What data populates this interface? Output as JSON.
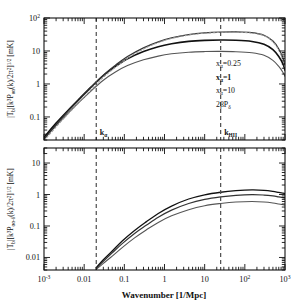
{
  "figure": {
    "background_color": "#ffffff",
    "frame_color": "#111111",
    "width": 299,
    "height": 308
  },
  "axes": {
    "xlabel": "Wavenumber [1/Mpc]",
    "x_ticklabels": [
      "10",
      "0.01",
      "0.1",
      "1",
      "10",
      "10",
      "10"
    ],
    "x_tick_exponents": [
      "-3",
      "",
      "",
      "",
      "",
      "2",
      "3"
    ],
    "x_tickvalues": [
      0.001,
      0.01,
      0.1,
      1,
      10,
      100,
      1000
    ],
    "xlim": [
      0.001,
      1000
    ],
    "top_y_ticklabels": [
      "10",
      "10",
      "1",
      "0.1"
    ],
    "top_y_tick_exponents": [
      "2",
      "",
      "",
      ""
    ],
    "top_y_tickvalues": [
      100,
      10,
      1,
      0.1
    ],
    "top_ylim": [
      0.02,
      100
    ],
    "bottom_y_ticklabels": [
      "10",
      "1",
      "0.1",
      "0.01"
    ],
    "bottom_y_tickvalues": [
      10,
      1,
      0.1,
      0.01
    ],
    "bottom_ylim": [
      0.004,
      30
    ]
  },
  "top_panel": {
    "ylabel_parts": {
      "p1": "|T",
      "p1_sub": "b",
      "p2": "|[k",
      "p2_sup": "3",
      "p3": "P",
      "p3_sub": "αα",
      "p4": "(k)/2π",
      "p4_sup": "2",
      "p5": "]",
      "p5_sup": "1/2",
      "p6": " [mK]"
    },
    "ylabel_plain": "|T_b|[k^3 P_aa(k)/2pi^2]^1/2 [mK]"
  },
  "bottom_panel": {
    "ylabel_parts": {
      "p1": "|T",
      "p1_sub": "b",
      "p2": "|[k",
      "p2_sup": "3",
      "p3": "P",
      "p3_sub": "αα-δ",
      "p4": "(k)/2π",
      "p4_sup": "2",
      "p5": "]",
      "p5_sup": "1/2",
      "p6": " [mK]"
    },
    "ylabel_plain": "|T_b|[k^3 P_aa-d(k)/2pi^2]^1/2 [mK]"
  },
  "vlines": [
    {
      "name": "k-alpha",
      "x": 0.02,
      "label_main": "k",
      "label_sub": "α",
      "color": "#4d4d4d",
      "dash": "4,3"
    },
    {
      "name": "k-HII",
      "x": 25,
      "label_main": "k",
      "label_sub": "HII",
      "color": "#4d4d4d",
      "dash": "4,3"
    }
  ],
  "legend": {
    "entries": [
      {
        "main": "x",
        "sub": "α",
        "rest": "=0.25",
        "color": "#555555",
        "weight": "normal"
      },
      {
        "main": "x",
        "sub": "α",
        "rest": "=1",
        "color": "#111111",
        "weight": "bold"
      },
      {
        "main": "x",
        "sub": "α",
        "rest": "=10",
        "color": "#333333",
        "weight": "normal"
      },
      {
        "main": "2βP",
        "sub": "δ",
        "rest": "",
        "color": "#9a9a9a",
        "weight": "normal"
      }
    ]
  },
  "chart_data": {
    "type": "line",
    "title": "",
    "xlabel": "Wavenumber [1/Mpc]",
    "xscale": "log",
    "yscale": "log",
    "xlim": [
      0.001,
      1000
    ],
    "grid": false,
    "legend_position": "right-middle",
    "panels": [
      {
        "name": "top",
        "ylabel": "|T_b|[k^3 P_aa(k)/2pi^2]^1/2 [mK]",
        "ylim": [
          0.02,
          100
        ],
        "series": [
          {
            "name": "x_a=0.25",
            "color": "#555555",
            "width": 1.1,
            "x": [
              0.001,
              0.002,
              0.004,
              0.008,
              0.015,
              0.03,
              0.06,
              0.12,
              0.3,
              0.7,
              1.5,
              4,
              10,
              25,
              60,
              150,
              300,
              500,
              700,
              900,
              1000
            ],
            "y": [
              0.022,
              0.055,
              0.13,
              0.3,
              0.62,
              1.3,
              2.3,
              3.6,
              5.4,
              7.0,
              8.2,
              9.2,
              9.6,
              9.7,
              9.5,
              8.8,
              7.4,
              5.2,
              3.4,
              2.2,
              1.7
            ]
          },
          {
            "name": "x_a=1",
            "color": "#111111",
            "width": 1.6,
            "x": [
              0.001,
              0.002,
              0.004,
              0.008,
              0.015,
              0.03,
              0.06,
              0.12,
              0.3,
              0.7,
              1.5,
              4,
              10,
              25,
              60,
              150,
              300,
              500,
              700,
              900,
              1000
            ],
            "y": [
              0.024,
              0.065,
              0.16,
              0.38,
              0.82,
              1.8,
              3.4,
              5.8,
              9.6,
              13.5,
              16.5,
              19.5,
              21.0,
              21.5,
              21.2,
              19.5,
              16.0,
              11.0,
              6.8,
              3.9,
              2.6
            ]
          },
          {
            "name": "x_a=10",
            "color": "#333333",
            "width": 1.3,
            "x": [
              0.001,
              0.002,
              0.004,
              0.008,
              0.015,
              0.03,
              0.06,
              0.12,
              0.3,
              0.7,
              1.5,
              4,
              10,
              25,
              60,
              150,
              300,
              500,
              700,
              900,
              1000
            ],
            "y": [
              0.021,
              0.058,
              0.15,
              0.36,
              0.8,
              1.85,
              3.7,
              6.8,
              12.5,
              19.0,
              25.0,
              31.5,
              35.5,
              37.5,
              38.0,
              36.0,
              30.0,
              20.0,
              11.5,
              5.8,
              3.5
            ]
          },
          {
            "name": "2bP_d",
            "color": "#9a9a9a",
            "width": 1.1,
            "dash": "2,2",
            "x": [
              0.001,
              0.002,
              0.004,
              0.008,
              0.015,
              0.03,
              0.06,
              0.12,
              0.3,
              0.7,
              1.5,
              4,
              10,
              25,
              60,
              150,
              300,
              500,
              700,
              900,
              1000
            ],
            "y": [
              0.019,
              0.05,
              0.125,
              0.3,
              0.68,
              1.6,
              3.2,
              6.0,
              11.5,
              18.0,
              24.0,
              30.5,
              34.5,
              36.5,
              37.0,
              35.0,
              29.0,
              19.0,
              10.5,
              5.2,
              3.0
            ]
          }
        ]
      },
      {
        "name": "bottom",
        "ylabel": "|T_b|[k^3 P_aa-d(k)/2pi^2]^1/2 [mK]",
        "ylim": [
          0.004,
          30
        ],
        "series": [
          {
            "name": "x_a=0.25",
            "color": "#555555",
            "width": 1.1,
            "x": [
              0.02,
              0.03,
              0.05,
              0.09,
              0.18,
              0.35,
              0.7,
              1.5,
              4,
              10,
              25,
              60,
              150,
              300,
              500,
              700,
              900,
              1000
            ],
            "y": [
              0.0042,
              0.0065,
              0.011,
              0.021,
              0.042,
              0.075,
              0.13,
              0.21,
              0.33,
              0.44,
              0.52,
              0.58,
              0.6,
              0.58,
              0.54,
              0.5,
              0.47,
              0.46
            ]
          },
          {
            "name": "x_a=1",
            "color": "#333333",
            "width": 1.2,
            "x": [
              0.02,
              0.03,
              0.05,
              0.09,
              0.18,
              0.35,
              0.7,
              1.5,
              4,
              10,
              25,
              60,
              150,
              300,
              500,
              700,
              900,
              1000
            ],
            "y": [
              0.0045,
              0.0075,
              0.014,
              0.028,
              0.058,
              0.105,
              0.19,
              0.32,
              0.52,
              0.7,
              0.84,
              0.94,
              0.99,
              0.96,
              0.9,
              0.84,
              0.8,
              0.78
            ]
          },
          {
            "name": "x_a=10",
            "color": "#111111",
            "width": 1.3,
            "x": [
              0.02,
              0.03,
              0.05,
              0.09,
              0.18,
              0.35,
              0.7,
              1.5,
              4,
              10,
              25,
              60,
              150,
              300,
              500,
              700,
              900,
              1000
            ],
            "y": [
              0.0048,
              0.0085,
              0.016,
              0.034,
              0.072,
              0.135,
              0.25,
              0.43,
              0.72,
              0.98,
              1.18,
              1.32,
              1.4,
              1.36,
              1.26,
              1.16,
              1.1,
              1.07
            ]
          }
        ]
      }
    ]
  }
}
